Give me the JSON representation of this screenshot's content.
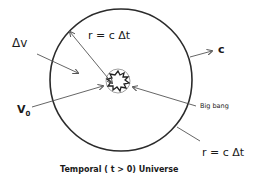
{
  "diagram": {
    "title": "Temporal ( t > 0) Universe",
    "labels": {
      "delta_v": "Δv",
      "radius_top": "r = c Δt",
      "speed_of_light": "c",
      "initial_velocity": "V",
      "initial_velocity_sub": "0",
      "big_bang": "Big bang",
      "radius_bottom": "r = c Δt"
    },
    "colors": {
      "stroke": "#2b2b2b",
      "arrow": "#555555",
      "text": "#1a1a1a",
      "background": "#ffffff"
    }
  }
}
